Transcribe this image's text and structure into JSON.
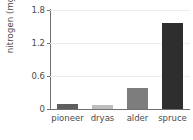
{
  "chart_data": {
    "type": "bar",
    "title": "",
    "xlabel": "",
    "ylabel": "nitrogen (mg/g)",
    "categories": [
      "pioneer",
      "dryas",
      "alder",
      "spruce"
    ],
    "values": [
      0.09,
      0.07,
      0.38,
      1.57
    ],
    "series": [
      {
        "name": "nitrogen",
        "values": [
          0.09,
          0.07,
          0.38,
          1.57
        ]
      }
    ],
    "bar_colors": [
      "#5e5e5e",
      "#bdbdbd",
      "#7d7d7d",
      "#2e2e2e"
    ],
    "ylim": [
      0,
      1.8
    ],
    "yticks": [
      0,
      0.6,
      1.2,
      1.8
    ],
    "ytick_labels": [
      "0",
      "0.6",
      "1.2",
      "1.8"
    ],
    "grid": true,
    "grid_axis": "y",
    "legend": false,
    "legend_position": "none",
    "axis_color": "#6f6f6f",
    "grid_color": "#ececec",
    "text_color": "#4a4a4a",
    "background_color": "#ffffff"
  }
}
